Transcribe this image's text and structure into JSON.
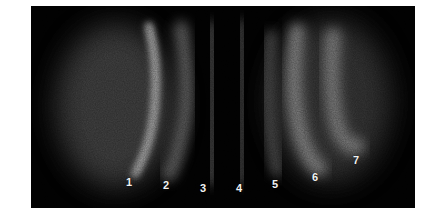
{
  "figure": {
    "background_color": "#020202",
    "band_labels": [
      {
        "id": 1,
        "text": "1",
        "x": 129,
        "y": 182
      },
      {
        "id": 2,
        "text": "2",
        "x": 166,
        "y": 185
      },
      {
        "id": 3,
        "text": "3",
        "x": 203,
        "y": 188
      },
      {
        "id": 4,
        "text": "4",
        "x": 239,
        "y": 188
      },
      {
        "id": 5,
        "text": "5",
        "x": 275,
        "y": 184
      },
      {
        "id": 6,
        "text": "6",
        "x": 315,
        "y": 177
      },
      {
        "id": 7,
        "text": "7",
        "x": 356,
        "y": 160
      }
    ]
  }
}
